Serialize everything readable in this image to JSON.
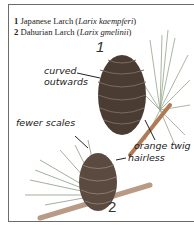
{
  "legend": [
    {
      "number": "1",
      "common": "Japanese Larch",
      "latin": "Larix kaempferi"
    },
    {
      "number": "2",
      "common": "Dahurian Larch",
      "latin": "Larix gmelinii"
    }
  ],
  "figure_numbers": {
    "first": "1",
    "second": "2"
  },
  "annotations": {
    "curved_line1": "curved",
    "curved_line2": "outwards",
    "orange_twig": "orange twig",
    "fewer_scales": "fewer scales",
    "hairless": "hairless"
  },
  "colors": {
    "border": "#6b6b6b",
    "cone": "#4a3b33",
    "needles": "#8a9a80",
    "twig": "#b07a55"
  }
}
